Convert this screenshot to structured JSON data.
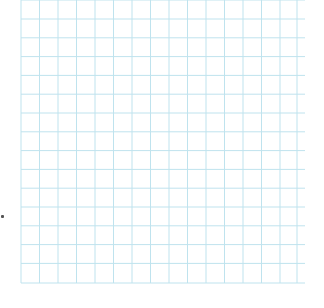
{
  "grid": {
    "line_color": "#bfe3ee",
    "background_color": "#ffffff",
    "x_start": 21,
    "x_end": 305,
    "y_start": 0,
    "y_end": 283,
    "vertical_lines_x": [
      21,
      39.5,
      58,
      76.5,
      95,
      113.5,
      132,
      150.5,
      169,
      187.5,
      206,
      224.5,
      243,
      261.5,
      280,
      297
    ],
    "horizontal_lines_y": [
      0,
      19,
      37.8,
      56.6,
      75.4,
      94.2,
      113,
      131.8,
      150.6,
      169.4,
      188.2,
      207,
      225.8,
      244.6,
      263.4,
      283
    ]
  },
  "artifact": {
    "speck_color": "#555555"
  }
}
